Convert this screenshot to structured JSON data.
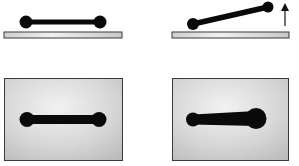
{
  "figure": {
    "panels": [
      {
        "id": "side-view-level",
        "view": "side",
        "state": "level bar on plate"
      },
      {
        "id": "side-view-tilted",
        "view": "side",
        "state": "bar tilted, right end lifted",
        "arrow": "up"
      },
      {
        "id": "top-view-symmetric",
        "view": "top",
        "state": "symmetric dumbbell on surface"
      },
      {
        "id": "top-view-asymmetric",
        "view": "top",
        "state": "asymmetric dumbbell, right end enlarged"
      }
    ],
    "colors": {
      "bar": "#0a0a0a",
      "plate_light": "#f2f2f2",
      "plate_dark": "#b8b8b8",
      "border": "#3a3a3a",
      "background": "#ffffff"
    }
  }
}
